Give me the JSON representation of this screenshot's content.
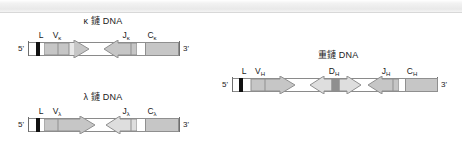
{
  "figure": {
    "kind": "immunoglobulin-gene-loci-diagram",
    "background_color": "#ffffff",
    "line_color": "#8a8a8a",
    "text_color": "#1a1a1a"
  },
  "loci": [
    {
      "id": "kappa",
      "title": "κ 鏈 DNA",
      "five_prime_label": "5'",
      "three_prime_label": "3'",
      "segments": [
        {
          "name": "L",
          "label": "L",
          "shape": "block",
          "fill": "#111111"
        },
        {
          "name": "V",
          "label": "V",
          "sub": "κ",
          "shape": "arrow-right",
          "fill": "#c6c6c6"
        },
        {
          "name": "J",
          "label": "J",
          "sub": "κ",
          "shape": "arrow-left",
          "fill": "#c6c6c6"
        },
        {
          "name": "C",
          "label": "C",
          "sub": "κ",
          "shape": "block",
          "fill": "#c6c6c6"
        }
      ]
    },
    {
      "id": "lambda",
      "title": "λ 鏈 DNA",
      "five_prime_label": "5'",
      "three_prime_label": "3'",
      "segments": [
        {
          "name": "L",
          "label": "L",
          "shape": "block",
          "fill": "#111111"
        },
        {
          "name": "V",
          "label": "V",
          "sub": "λ",
          "shape": "arrow-right",
          "fill": "#c6c6c6"
        },
        {
          "name": "J",
          "label": "J",
          "sub": "λ",
          "shape": "arrow-left",
          "fill": "#dedede"
        },
        {
          "name": "C",
          "label": "C",
          "sub": "λ",
          "shape": "block",
          "fill": "#c6c6c6"
        }
      ]
    },
    {
      "id": "heavy",
      "title": "重鏈 DNA",
      "five_prime_label": "5'",
      "three_prime_label": "3'",
      "segments": [
        {
          "name": "L",
          "label": "L",
          "shape": "block",
          "fill": "#111111"
        },
        {
          "name": "V",
          "label": "V",
          "sub": "H",
          "shape": "arrow-right",
          "fill": "#c6c6c6"
        },
        {
          "name": "D",
          "label": "D",
          "sub": "H",
          "shape": "double-arrow",
          "fill": "#dedede"
        },
        {
          "name": "J",
          "label": "J",
          "sub": "H",
          "shape": "arrow-left",
          "fill": "#c6c6c6"
        },
        {
          "name": "C",
          "label": "C",
          "sub": "H",
          "shape": "block",
          "fill": "#c6c6c6"
        }
      ]
    }
  ]
}
